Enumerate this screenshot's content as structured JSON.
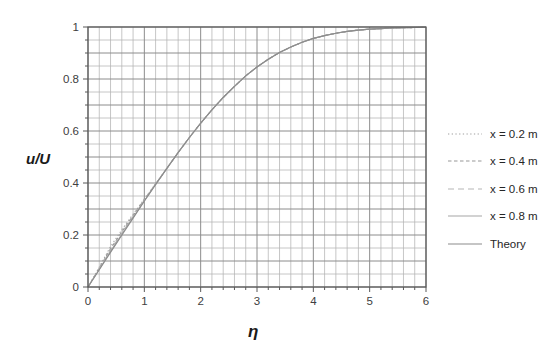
{
  "chart_data": {
    "type": "line",
    "title": "",
    "xlabel": "η",
    "ylabel": "u/U",
    "xlim": [
      0,
      6
    ],
    "ylim": [
      0,
      1
    ],
    "x_ticks": [
      0,
      1,
      2,
      3,
      4,
      5,
      6
    ],
    "y_ticks": [
      0,
      0.2,
      0.4,
      0.6,
      0.8,
      1
    ],
    "x_minor_step": 0.2,
    "x_major_step": 1,
    "y_minor_step": 0.05,
    "y_major_step": 0.1,
    "grid": "both",
    "legend_position": "right",
    "colors": {
      "minor_grid": "#b3b3b3",
      "major_grid": "#8c8c8c",
      "border": "#595959",
      "tick": "#595959",
      "tick_text": "#404040"
    },
    "x": [
      0,
      0.2,
      0.4,
      0.6,
      0.8,
      1.0,
      1.2,
      1.4,
      1.6,
      1.8,
      2.0,
      2.2,
      2.4,
      2.6,
      2.8,
      3.0,
      3.2,
      3.4,
      3.6,
      3.8,
      4.0,
      4.2,
      4.4,
      4.6,
      4.8,
      5.0,
      5.2,
      5.4,
      5.6,
      5.8,
      6.0
    ],
    "series": [
      {
        "name": "x = 0.2 m",
        "dash": "1.3,2.4",
        "color": "#a0a0a0",
        "values": [
          0,
          0.077,
          0.155,
          0.22,
          0.28,
          0.339,
          0.397,
          0.457,
          0.517,
          0.575,
          0.63,
          0.681,
          0.729,
          0.772,
          0.812,
          0.846,
          0.876,
          0.902,
          0.923,
          0.941,
          0.956,
          0.967,
          0.976,
          0.983,
          0.988,
          0.992,
          0.994,
          0.996,
          0.997,
          0.998,
          0.999
        ]
      },
      {
        "name": "x = 0.4 m",
        "dash": "3.5,2.5",
        "color": "#979797",
        "values": [
          0,
          0.073,
          0.147,
          0.212,
          0.275,
          0.336,
          0.396,
          0.457,
          0.517,
          0.575,
          0.63,
          0.681,
          0.729,
          0.772,
          0.812,
          0.846,
          0.876,
          0.902,
          0.923,
          0.941,
          0.956,
          0.967,
          0.976,
          0.983,
          0.988,
          0.992,
          0.994,
          0.996,
          0.997,
          0.998,
          0.999
        ]
      },
      {
        "name": "x = 0.6 m",
        "dash": "6,4",
        "color": "#b5b5b5",
        "values": [
          0,
          0.07,
          0.141,
          0.207,
          0.271,
          0.333,
          0.395,
          0.456,
          0.517,
          0.575,
          0.63,
          0.681,
          0.729,
          0.772,
          0.812,
          0.846,
          0.876,
          0.902,
          0.923,
          0.941,
          0.956,
          0.967,
          0.976,
          0.983,
          0.988,
          0.992,
          0.994,
          0.996,
          0.997,
          0.998,
          0.999
        ]
      },
      {
        "name": "x = 0.8 m",
        "dash": "",
        "color": "#a6a6a6",
        "values": [
          0,
          0.068,
          0.137,
          0.203,
          0.268,
          0.332,
          0.395,
          0.456,
          0.517,
          0.575,
          0.63,
          0.681,
          0.729,
          0.772,
          0.812,
          0.846,
          0.876,
          0.902,
          0.923,
          0.941,
          0.956,
          0.967,
          0.976,
          0.983,
          0.988,
          0.992,
          0.994,
          0.996,
          0.997,
          0.998,
          0.999
        ]
      },
      {
        "name": "Theory",
        "dash": "",
        "color": "#8c8c8c",
        "values": [
          0,
          0.066,
          0.133,
          0.199,
          0.265,
          0.33,
          0.394,
          0.456,
          0.517,
          0.575,
          0.63,
          0.681,
          0.729,
          0.772,
          0.812,
          0.846,
          0.876,
          0.902,
          0.923,
          0.941,
          0.956,
          0.967,
          0.976,
          0.983,
          0.988,
          0.992,
          0.994,
          0.996,
          0.997,
          0.998,
          0.999
        ]
      }
    ]
  }
}
